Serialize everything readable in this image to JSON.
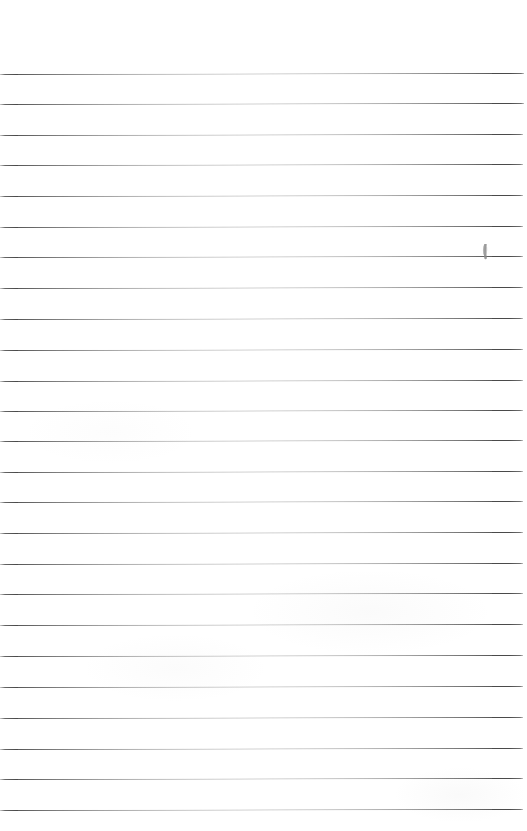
{
  "page": {
    "width_px": 527,
    "height_px": 831,
    "background_color": "#ffffff"
  },
  "ruling": {
    "line_color": "#4a4a4a",
    "line_thickness_px": 1,
    "line_count": 25,
    "line_spacing_px": 30.7,
    "first_line_y_px": 74,
    "last_line_y_px": 810,
    "left_inset_px": 0,
    "right_inset_px": 5,
    "top_margin_px": 74,
    "bottom_margin_px": 21,
    "lines": [
      {
        "index": 1,
        "y": 74,
        "left_x": 0,
        "right_x": 524,
        "tilt_px": 1
      },
      {
        "index": 2,
        "y": 104,
        "left_x": 0,
        "right_x": 524,
        "tilt_px": 1
      },
      {
        "index": 3,
        "y": 135,
        "left_x": 0,
        "right_x": 523,
        "tilt_px": 1
      },
      {
        "index": 4,
        "y": 165,
        "left_x": 0,
        "right_x": 523,
        "tilt_px": 1
      },
      {
        "index": 5,
        "y": 196,
        "left_x": 0,
        "right_x": 523,
        "tilt_px": 1
      },
      {
        "index": 6,
        "y": 227,
        "left_x": 0,
        "right_x": 523,
        "tilt_px": 1
      },
      {
        "index": 7,
        "y": 257,
        "left_x": 0,
        "right_x": 523,
        "tilt_px": 1
      },
      {
        "index": 8,
        "y": 288,
        "left_x": 0,
        "right_x": 523,
        "tilt_px": 1
      },
      {
        "index": 9,
        "y": 319,
        "left_x": 0,
        "right_x": 523,
        "tilt_px": 1
      },
      {
        "index": 10,
        "y": 350,
        "left_x": 0,
        "right_x": 523,
        "tilt_px": 1
      },
      {
        "index": 11,
        "y": 381,
        "left_x": 0,
        "right_x": 523,
        "tilt_px": 1
      },
      {
        "index": 12,
        "y": 411,
        "left_x": 0,
        "right_x": 523,
        "tilt_px": 1
      },
      {
        "index": 13,
        "y": 441,
        "left_x": 0,
        "right_x": 523,
        "tilt_px": 1
      },
      {
        "index": 14,
        "y": 472,
        "left_x": 0,
        "right_x": 523,
        "tilt_px": 1
      },
      {
        "index": 15,
        "y": 502,
        "left_x": 0,
        "right_x": 523,
        "tilt_px": 1
      },
      {
        "index": 16,
        "y": 533,
        "left_x": 0,
        "right_x": 523,
        "tilt_px": 1
      },
      {
        "index": 17,
        "y": 564,
        "left_x": 0,
        "right_x": 523,
        "tilt_px": 1
      },
      {
        "index": 18,
        "y": 594,
        "left_x": 0,
        "right_x": 523,
        "tilt_px": 1
      },
      {
        "index": 19,
        "y": 625,
        "left_x": 0,
        "right_x": 523,
        "tilt_px": 1
      },
      {
        "index": 20,
        "y": 656,
        "left_x": 0,
        "right_x": 523,
        "tilt_px": 1
      },
      {
        "index": 21,
        "y": 687,
        "left_x": 0,
        "right_x": 523,
        "tilt_px": 1
      },
      {
        "index": 22,
        "y": 718,
        "left_x": 0,
        "right_x": 523,
        "tilt_px": 1
      },
      {
        "index": 23,
        "y": 749,
        "left_x": 0,
        "right_x": 523,
        "tilt_px": 1
      },
      {
        "index": 24,
        "y": 779,
        "left_x": 0,
        "right_x": 523,
        "tilt_px": 1
      },
      {
        "index": 25,
        "y": 810,
        "left_x": 0,
        "right_x": 523,
        "tilt_px": 1
      }
    ]
  },
  "annotations": [
    {
      "name": "pencil-tick-mark",
      "kind": "handwritten-mark",
      "shape": "short vertical pencil stroke",
      "color": "#8c8c8c",
      "x": 481,
      "y": 244,
      "width": 7,
      "height": 14,
      "on_line_index": 6
    }
  ],
  "content": {
    "written_text": "",
    "has_text": false,
    "note": "Page is blank — no handwriting or printed text beyond the rules"
  }
}
